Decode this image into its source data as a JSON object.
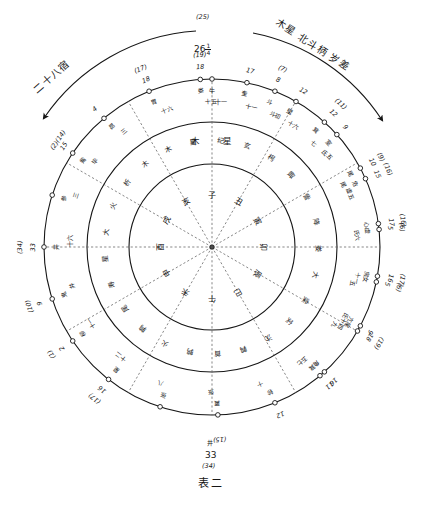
{
  "figure": {
    "caption": "表二",
    "title_left_arc": "二十八宿",
    "title_right_arc": "木星 北斗柄 岁差",
    "top_paren": "(25)",
    "top_value_int": "26",
    "top_value_num": "1",
    "top_value_den": "4",
    "bottom_mansion": "井",
    "bottom_value": "33",
    "bottom_paren": "(34)",
    "ink": "#161616",
    "paper": "#ffffff"
  },
  "inner_ring": {
    "name": "十二地支",
    "cells": [
      "子",
      "丑",
      "寅",
      "卯",
      "辰",
      "巳",
      "午",
      "未",
      "申",
      "酉",
      "戌",
      "亥"
    ]
  },
  "middle_ring": {
    "name": "十二次 / 木星",
    "cells": [
      "星",
      "纪",
      "玄",
      "枵",
      "娵",
      "訾",
      "降",
      "娄",
      "大",
      "梁",
      "实",
      "沈",
      "鹑",
      "首",
      "鹑",
      "火",
      "鹑",
      "尾",
      "寿",
      "星",
      "大",
      "火",
      "析",
      "木",
      "木"
    ],
    "highlight": [
      "木",
      "星"
    ]
  },
  "outer_ring": {
    "name": "二十八宿刻度",
    "marks": [
      {
        "angle": 0,
        "mansion": "牛",
        "degree": "十一",
        "degree2": "十二",
        "num": "",
        "paren": ""
      },
      {
        "angle": 22,
        "mansion": "斗",
        "degree": "斗初",
        "num": "8",
        "paren": "(7)"
      },
      {
        "angle": 42,
        "mansion": "箕",
        "degree": "七",
        "num": "12",
        "paren": "(11)"
      },
      {
        "angle": 62,
        "mansion": "尾",
        "degree": "尾",
        "num": "10",
        "paren": "(9)"
      },
      {
        "angle": 82,
        "mansion": "心",
        "degree": "氏",
        "num": "17",
        "paren": "(16)"
      },
      {
        "angle": 100,
        "mansion": "房",
        "degree": "十一",
        "num": "16",
        "paren": "(17)"
      },
      {
        "angle": 118,
        "mansion": "亢",
        "degree": "氏十四",
        "num": "9",
        "paren": ""
      },
      {
        "angle": 138,
        "mansion": "角",
        "degree": "五",
        "num": "16",
        "paren": ""
      },
      {
        "angle": 158,
        "mansion": "轸",
        "degree": "十",
        "num": "12",
        "paren": ""
      },
      {
        "angle": 178,
        "mansion": "翼",
        "degree": "张",
        "num": "",
        "paren": "(15)"
      },
      {
        "angle": 198,
        "mansion": "张",
        "degree": "八",
        "num": "",
        "paren": ""
      },
      {
        "angle": 218,
        "mansion": "星",
        "degree": "十二",
        "num": "16",
        "paren": "(17)"
      },
      {
        "angle": 236,
        "mansion": "柳",
        "degree": "十一",
        "num": "2",
        "paren": "(1)"
      },
      {
        "angle": 252,
        "mansion": "鬼",
        "degree": "井",
        "num": "9",
        "paren": "(10)"
      },
      {
        "angle": 270,
        "mansion": "井",
        "degree": "十六",
        "num": "33",
        "paren": "(34)"
      },
      {
        "angle": 288,
        "mansion": "参",
        "degree": "三",
        "num": "",
        "paren": ""
      },
      {
        "angle": 304,
        "mansion": "觜",
        "degree": "毕",
        "num": "15",
        "paren": "(2)(14)"
      },
      {
        "angle": 320,
        "mansion": "昴",
        "degree": "三",
        "num": "4",
        "paren": ""
      },
      {
        "angle": 338,
        "mansion": "胃",
        "degree": "十六",
        "num": "18",
        "paren": "(17)"
      },
      {
        "angle": 356,
        "mansion": "娄",
        "degree": "十五",
        "num": "18",
        "paren": "(19)"
      },
      {
        "angle": 12,
        "mansion": "奎",
        "degree": "十一",
        "num": "17",
        "paren": ""
      },
      {
        "angle": 30,
        "mansion": "壁",
        "degree": "十六",
        "num": "12",
        "paren": ""
      },
      {
        "angle": 48,
        "mansion": "室",
        "degree": "氐五",
        "num": "9",
        "paren": ""
      },
      {
        "angle": 66,
        "mansion": "危",
        "degree": "虚五",
        "num": "15",
        "paren": "(16)"
      },
      {
        "angle": 84,
        "mansion": "虚",
        "degree": "六",
        "num": "5",
        "paren": "(6)"
      },
      {
        "angle": 102,
        "mansion": "女",
        "degree": "五",
        "num": "5",
        "paren": "(6)"
      },
      {
        "angle": 120,
        "mansion": "尾",
        "degree": "九",
        "num": "18",
        "paren": "(19)"
      },
      {
        "angle": 140,
        "mansion": "箕",
        "degree": "七",
        "num": "11",
        "paren": ""
      }
    ]
  },
  "outer_numeric_labels": [
    {
      "pos": "top",
      "paren": "(25)",
      "num": "26"
    },
    {
      "pos": "top-right-1",
      "paren": "(7)",
      "num": "8"
    },
    {
      "pos": "top-right-2",
      "paren": "(11)",
      "num": "12"
    },
    {
      "pos": "top-right-3",
      "paren": "(9)",
      "num": "10"
    },
    {
      "pos": "top-right-4",
      "paren": "(16)",
      "num": "17"
    },
    {
      "pos": "right-1",
      "paren": "(17)",
      "num": "16"
    },
    {
      "pos": "right-2",
      "paren": "",
      "num": "9"
    },
    {
      "pos": "right-3",
      "paren": "",
      "num": "16"
    },
    {
      "pos": "right-4",
      "paren": "",
      "num": "12"
    },
    {
      "pos": "bottom-right-1",
      "paren": "(15)",
      "num": ""
    },
    {
      "pos": "bottom-right-2",
      "paren": "(17)(1)(10)",
      "num": "16 2 9"
    },
    {
      "pos": "bottom",
      "paren": "(34)",
      "num": "33"
    },
    {
      "pos": "bottom-left-1",
      "paren": "(2)(14)",
      "num": "15 4"
    },
    {
      "pos": "bottom-left-2",
      "paren": "(17)",
      "num": "18"
    },
    {
      "pos": "left-1",
      "paren": "(19)",
      "num": "18"
    },
    {
      "pos": "left-2",
      "paren": "",
      "num": "17"
    },
    {
      "pos": "left-3",
      "paren": "",
      "num": "12"
    },
    {
      "pos": "left-4",
      "paren": "",
      "num": "9"
    },
    {
      "pos": "top-left-1",
      "paren": "(16)",
      "num": "15"
    },
    {
      "pos": "top-left-2",
      "paren": "(6)",
      "num": "5"
    },
    {
      "pos": "top-left-3",
      "paren": "(6)",
      "num": "5"
    },
    {
      "pos": "top-left-4",
      "paren": "(19)",
      "num": "18"
    },
    {
      "pos": "top-left-5",
      "paren": "",
      "num": "11"
    }
  ]
}
